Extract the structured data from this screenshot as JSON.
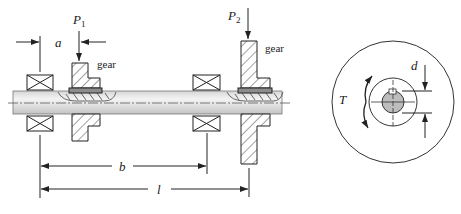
{
  "diagram": {
    "type": "shaft-gear-bearing-assembly",
    "side_view": {
      "loads": [
        {
          "symbol": "P",
          "subscript": "1"
        },
        {
          "symbol": "P",
          "subscript": "2"
        }
      ],
      "gear_labels": [
        "gear",
        "gear"
      ],
      "dimensions": {
        "a": "a",
        "b": "b",
        "l": "l"
      }
    },
    "end_view": {
      "torque_label": "T",
      "diameter_label": "d"
    },
    "colors": {
      "line": "#333333",
      "shaft_light": "#f2f2f2",
      "shaft_dark": "#c8c8c8",
      "key": "#8c8c8c",
      "shaft_section": "#bdbdbd"
    }
  }
}
